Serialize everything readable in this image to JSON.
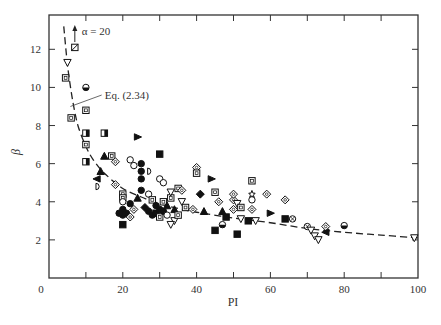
{
  "chart_data": {
    "type": "scatter",
    "title": "",
    "xlabel": "PI",
    "ylabel": "β",
    "xlim": [
      0,
      100
    ],
    "ylim": [
      0,
      13.8
    ],
    "xticks": [
      0,
      20,
      40,
      60,
      80,
      100
    ],
    "xticks_minor": [
      10,
      30,
      50,
      70,
      90
    ],
    "yticks": [
      2,
      4,
      6,
      8,
      10,
      12
    ],
    "grid": false,
    "annotations": [
      {
        "text": "α = 20",
        "x": 7,
        "y": 12.8,
        "arrow": "up"
      },
      {
        "text": "Eq. (2.34)",
        "x": 14,
        "y": 9.6,
        "leader_to": [
          5.8,
          9.0
        ]
      }
    ],
    "curve": {
      "name": "Eq. (2.34)",
      "style": "dashed",
      "x": [
        4,
        5,
        6,
        7,
        8,
        10,
        12,
        15,
        20,
        25,
        30,
        35,
        40,
        50,
        60,
        70,
        80,
        90,
        100
      ],
      "y": [
        13.2,
        11.2,
        9.8,
        8.7,
        7.9,
        6.9,
        6.2,
        5.5,
        4.7,
        4.25,
        3.9,
        3.65,
        3.45,
        3.15,
        2.9,
        2.6,
        2.4,
        2.25,
        2.1
      ]
    },
    "points": [
      {
        "x": 7,
        "y": 12.1,
        "m": "sq-x"
      },
      {
        "x": 5,
        "y": 11.3,
        "m": "tri-down"
      },
      {
        "x": 4.5,
        "y": 10.5,
        "m": "sq"
      },
      {
        "x": 10,
        "y": 10.0,
        "m": "circle-half"
      },
      {
        "x": 10,
        "y": 8.8,
        "m": "sq"
      },
      {
        "x": 6,
        "y": 8.4,
        "m": "sq"
      },
      {
        "x": 10,
        "y": 7.6,
        "m": "sq-half"
      },
      {
        "x": 15,
        "y": 7.6,
        "m": "sq-half"
      },
      {
        "x": 10,
        "y": 7.0,
        "m": "sq"
      },
      {
        "x": 24,
        "y": 7.4,
        "m": "tri-right"
      },
      {
        "x": 10,
        "y": 6.1,
        "m": "sq-half"
      },
      {
        "x": 15,
        "y": 6.4,
        "m": "tri"
      },
      {
        "x": 17,
        "y": 6.4,
        "m": "sq"
      },
      {
        "x": 18,
        "y": 6.1,
        "m": "diamond"
      },
      {
        "x": 14,
        "y": 5.6,
        "m": "tri"
      },
      {
        "x": 13,
        "y": 5.2,
        "m": "tri-left"
      },
      {
        "x": 13,
        "y": 4.8,
        "m": "half-left"
      },
      {
        "x": 18,
        "y": 4.9,
        "m": "diamond"
      },
      {
        "x": 22,
        "y": 6.2,
        "m": "circle"
      },
      {
        "x": 23,
        "y": 5.9,
        "m": "circle"
      },
      {
        "x": 25,
        "y": 6.0,
        "m": "circle-fill"
      },
      {
        "x": 25,
        "y": 5.6,
        "m": "circle-fill"
      },
      {
        "x": 25,
        "y": 5.2,
        "m": "circle-fill"
      },
      {
        "x": 27,
        "y": 5.6,
        "m": "half-left"
      },
      {
        "x": 20,
        "y": 4.4,
        "m": "sq"
      },
      {
        "x": 20,
        "y": 4.2,
        "m": "sq"
      },
      {
        "x": 20,
        "y": 4.0,
        "m": "circle"
      },
      {
        "x": 22,
        "y": 3.9,
        "m": "circle-fill"
      },
      {
        "x": 20,
        "y": 3.6,
        "m": "circle-fill"
      },
      {
        "x": 21,
        "y": 3.4,
        "m": "circle-fill"
      },
      {
        "x": 20,
        "y": 3.3,
        "m": "circle-fill"
      },
      {
        "x": 22,
        "y": 3.2,
        "m": "diamond"
      },
      {
        "x": 19,
        "y": 3.4,
        "m": "circle-fill"
      },
      {
        "x": 23,
        "y": 3.6,
        "m": "diamond"
      },
      {
        "x": 20,
        "y": 2.8,
        "m": "sq-fill"
      },
      {
        "x": 24,
        "y": 4.2,
        "m": "tri"
      },
      {
        "x": 25,
        "y": 4.6,
        "m": "circle-fill"
      },
      {
        "x": 27,
        "y": 4.4,
        "m": "circle"
      },
      {
        "x": 28,
        "y": 4.1,
        "m": "sq"
      },
      {
        "x": 26,
        "y": 3.7,
        "m": "diamond-fill"
      },
      {
        "x": 27,
        "y": 3.5,
        "m": "circle-fill"
      },
      {
        "x": 28,
        "y": 3.3,
        "m": "circle-fill"
      },
      {
        "x": 29,
        "y": 3.8,
        "m": "circle-fill"
      },
      {
        "x": 29,
        "y": 3.4,
        "m": "sq-fill"
      },
      {
        "x": 30,
        "y": 3.6,
        "m": "circle-fill"
      },
      {
        "x": 30,
        "y": 3.2,
        "m": "sq"
      },
      {
        "x": 31,
        "y": 4.0,
        "m": "sq"
      },
      {
        "x": 31,
        "y": 3.5,
        "m": "circle-fill"
      },
      {
        "x": 32,
        "y": 3.8,
        "m": "tri"
      },
      {
        "x": 32,
        "y": 3.3,
        "m": "circle"
      },
      {
        "x": 33,
        "y": 4.2,
        "m": "sq"
      },
      {
        "x": 34,
        "y": 3.6,
        "m": "tri"
      },
      {
        "x": 34,
        "y": 3.0,
        "m": "tri-down"
      },
      {
        "x": 35,
        "y": 3.3,
        "m": "sq"
      },
      {
        "x": 33,
        "y": 2.8,
        "m": "tri-down"
      },
      {
        "x": 36,
        "y": 4.0,
        "m": "tri-down"
      },
      {
        "x": 37,
        "y": 3.7,
        "m": "sq"
      },
      {
        "x": 30,
        "y": 5.2,
        "m": "circle"
      },
      {
        "x": 31,
        "y": 5.0,
        "m": "circle"
      },
      {
        "x": 33,
        "y": 4.5,
        "m": "tri-down"
      },
      {
        "x": 30,
        "y": 6.5,
        "m": "sq-fill"
      },
      {
        "x": 35,
        "y": 4.7,
        "m": "sq"
      },
      {
        "x": 36,
        "y": 4.6,
        "m": "diamond"
      },
      {
        "x": 40,
        "y": 5.8,
        "m": "diamond"
      },
      {
        "x": 40,
        "y": 5.5,
        "m": "sq"
      },
      {
        "x": 41,
        "y": 4.4,
        "m": "diamond-fill"
      },
      {
        "x": 42,
        "y": 3.5,
        "m": "tri"
      },
      {
        "x": 39,
        "y": 3.6,
        "m": "diamond"
      },
      {
        "x": 44,
        "y": 5.2,
        "m": "tri-right"
      },
      {
        "x": 45,
        "y": 4.5,
        "m": "sq"
      },
      {
        "x": 46,
        "y": 4.0,
        "m": "diamond"
      },
      {
        "x": 47,
        "y": 3.5,
        "m": "tri"
      },
      {
        "x": 48,
        "y": 3.2,
        "m": "sq-fill"
      },
      {
        "x": 50,
        "y": 3.6,
        "m": "diamond"
      },
      {
        "x": 50,
        "y": 4.1,
        "m": "diamond"
      },
      {
        "x": 50,
        "y": 4.4,
        "m": "diamond"
      },
      {
        "x": 51,
        "y": 3.9,
        "m": "tri-down"
      },
      {
        "x": 52,
        "y": 3.7,
        "m": "sq"
      },
      {
        "x": 52,
        "y": 3.1,
        "m": "tri-down"
      },
      {
        "x": 47,
        "y": 2.8,
        "m": "circle-half"
      },
      {
        "x": 45,
        "y": 2.5,
        "m": "sq-fill"
      },
      {
        "x": 51,
        "y": 2.3,
        "m": "sq-fill"
      },
      {
        "x": 54,
        "y": 3.0,
        "m": "sq-fill"
      },
      {
        "x": 55,
        "y": 5.1,
        "m": "sq"
      },
      {
        "x": 55,
        "y": 4.4,
        "m": "star"
      },
      {
        "x": 55,
        "y": 4.1,
        "m": "circle"
      },
      {
        "x": 55,
        "y": 3.6,
        "m": "diamond"
      },
      {
        "x": 56,
        "y": 3.0,
        "m": "tri-down"
      },
      {
        "x": 59,
        "y": 4.4,
        "m": "diamond"
      },
      {
        "x": 60,
        "y": 3.4,
        "m": "tri-right"
      },
      {
        "x": 64,
        "y": 4.1,
        "m": "diamond"
      },
      {
        "x": 64,
        "y": 3.1,
        "m": "sq-fill"
      },
      {
        "x": 66,
        "y": 3.1,
        "m": "circle-x"
      },
      {
        "x": 70,
        "y": 2.7,
        "m": "circle-x"
      },
      {
        "x": 71,
        "y": 2.5,
        "m": "tri-down"
      },
      {
        "x": 72,
        "y": 2.2,
        "m": "tri-down"
      },
      {
        "x": 73,
        "y": 2.0,
        "m": "tri-down"
      },
      {
        "x": 75,
        "y": 2.7,
        "m": "diamond"
      },
      {
        "x": 75,
        "y": 2.4,
        "m": "tri-left"
      },
      {
        "x": 80,
        "y": 2.75,
        "m": "circle-half"
      },
      {
        "x": 99,
        "y": 2.1,
        "m": "tri-down"
      }
    ]
  },
  "caption": "Figure 2.x"
}
